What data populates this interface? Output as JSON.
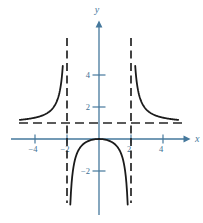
{
  "figure": {
    "background": "#ffffff",
    "axis_color": "#45789c",
    "tick_label_color": "#3d6f93",
    "curve_color": "#1b1b1b",
    "asymptote_color": "#242424"
  },
  "chart_data": {
    "type": "line",
    "function": "y = x^2 / (x^2 - 4)",
    "formula": {
      "numerator_coeffs": [
        1,
        0,
        0
      ],
      "denominator_coeffs": [
        1,
        0,
        -4
      ]
    },
    "xlabel": "x",
    "ylabel": "y",
    "xlim": [
      -5.6,
      6.1
    ],
    "ylim": [
      -5.3,
      5.7
    ],
    "x_ticks": [
      {
        "value": -4,
        "label": "−4"
      },
      {
        "value": -2,
        "label": "−2"
      },
      {
        "value": 2,
        "label": "2"
      },
      {
        "value": 4,
        "label": "4"
      }
    ],
    "y_ticks": [
      {
        "value": 4,
        "label": "4"
      },
      {
        "value": 2,
        "label": "2"
      },
      {
        "value": -2,
        "label": "−2"
      }
    ],
    "asymptotes": {
      "vertical_x": [
        -2,
        2
      ],
      "horizontal_y": [
        1
      ]
    },
    "grid": false,
    "legend": null,
    "series": [
      {
        "name": "left-branch",
        "x_range": [
          -4.95,
          -2.263
        ]
      },
      {
        "name": "middle-branch",
        "x_range": [
          -1.793,
          1.793
        ]
      },
      {
        "name": "right-branch",
        "x_range": [
          2.263,
          4.95
        ]
      }
    ],
    "key_points": [
      [
        -4,
        1.33
      ],
      [
        -3,
        1.8
      ],
      [
        -2.263,
        4.57
      ],
      [
        -1.793,
        -4.1
      ],
      [
        0,
        0
      ],
      [
        1.793,
        -4.1
      ],
      [
        2.263,
        4.57
      ],
      [
        3,
        1.8
      ],
      [
        4,
        1.33
      ]
    ]
  }
}
